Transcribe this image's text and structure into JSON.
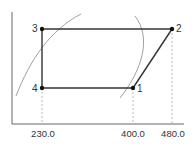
{
  "diagram": {
    "type": "thermodynamic-cycle",
    "axes": {
      "x_ticks": [
        "230.0",
        "400.0",
        "480.0"
      ]
    },
    "points": [
      {
        "id": "1",
        "label": "1"
      },
      {
        "id": "2",
        "label": "2"
      },
      {
        "id": "3",
        "label": "3"
      },
      {
        "id": "4",
        "label": "4"
      }
    ],
    "colors": {
      "cycle": "#222222",
      "curve": "#888888",
      "axis": "#555555",
      "dash": "#aaaaaa"
    }
  }
}
